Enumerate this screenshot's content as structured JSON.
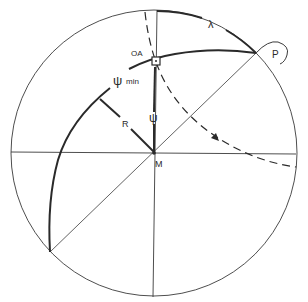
{
  "diagram": {
    "labels": {
      "oa": "OA",
      "lambda": "λ",
      "p": "P",
      "psi_min_symbol": "ψ",
      "psi_min_sub": "min",
      "r": "R",
      "psi": "ψ",
      "m": "M"
    },
    "colors": {
      "stroke": "#2a2a2a",
      "background": "#ffffff"
    }
  }
}
